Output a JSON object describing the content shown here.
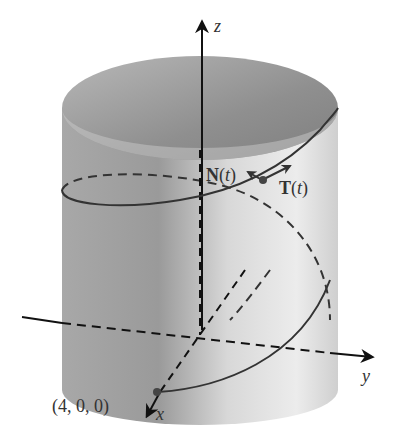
{
  "figure": {
    "axes": {
      "z_label": "z",
      "y_label": "y",
      "x_label": "x"
    },
    "vectors": {
      "normal_label_main": "N",
      "normal_label_arg": "t",
      "tangent_label_main": "T",
      "tangent_label_arg": "t"
    },
    "point": {
      "label": "(4, 0, 0)"
    },
    "colors": {
      "cylinder_dark": "#8c8c8c",
      "cylinder_light": "#e6e6e6",
      "top_ellipse": "#9a9a9a",
      "curve": "#333333",
      "axes": "#111111"
    }
  }
}
